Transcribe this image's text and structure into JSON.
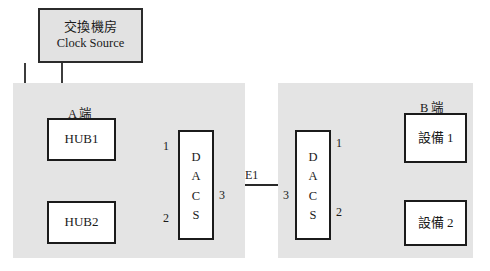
{
  "diagram": {
    "title_box": {
      "line_cn": "交換機房",
      "line_en": "Clock Source"
    },
    "panels": {
      "left_label": "A 端",
      "right_label": "B 端"
    },
    "nodes": {
      "hub1": "HUB1",
      "hub2": "HUB2",
      "dacs_left": "DACS",
      "dacs_right": "DACS",
      "device1": "設備 1",
      "device2": "設備 2"
    },
    "edge_labels": {
      "left_port_1": "1",
      "left_port_2": "2",
      "left_port_3": "3",
      "right_port_1": "1",
      "right_port_2": "2",
      "right_port_3": "3",
      "trunk": "E1"
    },
    "colors": {
      "panel_fill": "#e4e4e4",
      "clock_fill": "#e2e2e2",
      "node_fill": "#ffffff",
      "stroke": "#1b1b1b",
      "page_bg": "#ffffff"
    }
  }
}
